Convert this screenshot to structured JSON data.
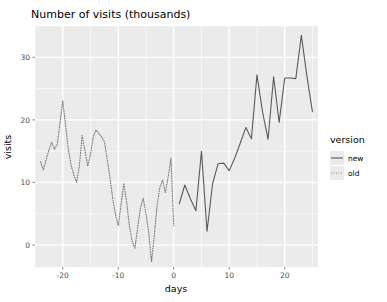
{
  "chart_data": {
    "type": "line",
    "title": "Number of visits (thousands)",
    "xlabel": "days",
    "ylabel": "visits",
    "xlim": [
      -25,
      26
    ],
    "ylim": [
      -3.5,
      35
    ],
    "grid": true,
    "legend": {
      "title": "version",
      "position": "right",
      "entries": [
        {
          "label": "new",
          "style": "solid",
          "color": "#5a5a5a"
        },
        {
          "label": "old",
          "style": "dotted",
          "color": "#7f7f7f"
        }
      ]
    },
    "xticks": [
      -20,
      -10,
      0,
      10,
      20
    ],
    "xtick_labels": [
      "-20",
      "-10",
      "0",
      "10",
      "20"
    ],
    "yticks": [
      0,
      10,
      20,
      30
    ],
    "ytick_labels": [
      "0",
      "10",
      "20",
      "30"
    ],
    "x_minor": [
      -25,
      -15,
      -5,
      5,
      15,
      25
    ],
    "y_minor": [
      -5,
      5,
      15,
      25,
      35
    ],
    "series": [
      {
        "name": "old",
        "style": "dotted",
        "color": "#7f7f7f",
        "x": [
          -24,
          -23.5,
          -23,
          -22.5,
          -22,
          -21.5,
          -21,
          -20.5,
          -20,
          -19.5,
          -19,
          -18.5,
          -18,
          -17.5,
          -17,
          -16.5,
          -16,
          -15.5,
          -15,
          -14.5,
          -14,
          -13.5,
          -13,
          -12.5,
          -12,
          -11.5,
          -11,
          -10.5,
          -10,
          -9.5,
          -9,
          -8.5,
          -8,
          -7.5,
          -7,
          -6.5,
          -6,
          -5.5,
          -5,
          -4.5,
          -4,
          -3.5,
          -3,
          -2.5,
          -2,
          -1.5,
          -1,
          -0.5,
          0
        ],
        "y": [
          13.3,
          12.0,
          13.6,
          15.2,
          16.4,
          15.3,
          16.1,
          19.5,
          23.1,
          19.2,
          15.4,
          12.8,
          11.2,
          10.0,
          12.7,
          17.5,
          15.1,
          12.6,
          14.5,
          17.3,
          18.4,
          17.8,
          17.3,
          16.5,
          13.8,
          10.9,
          7.5,
          4.9,
          3.1,
          6.4,
          9.9,
          7.0,
          3.2,
          0.6,
          -0.5,
          2.8,
          5.9,
          7.5,
          5.0,
          1.9,
          -2.6,
          1.5,
          6.3,
          9.2,
          10.4,
          8.4,
          10.9,
          13.9,
          3.1
        ]
      },
      {
        "name": "new",
        "style": "solid",
        "color": "#5a5a5a",
        "x": [
          1,
          2,
          3,
          4,
          5,
          6,
          7,
          8,
          9,
          10,
          11,
          12,
          13,
          14,
          15,
          16,
          17,
          18,
          19,
          20,
          21,
          22,
          23,
          24,
          25
        ],
        "y": [
          6.6,
          9.6,
          7.4,
          5.5,
          15.0,
          2.2,
          9.8,
          13.0,
          13.1,
          11.9,
          13.9,
          16.3,
          18.8,
          17.0,
          27.2,
          21.3,
          16.9,
          26.9,
          19.6,
          26.7,
          26.7,
          26.6,
          33.5,
          27.0,
          21.3
        ]
      }
    ]
  },
  "theme": {
    "panel_bg": "#ebebeb",
    "grid_major": "#ffffff",
    "grid_minor": "#ffffff",
    "page_bg": "#ffffff",
    "tick_text": "#4d4d4d",
    "title_text": "#000000"
  }
}
